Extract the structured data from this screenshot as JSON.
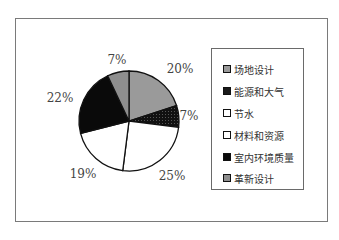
{
  "chart_data": {
    "type": "pie",
    "title": "",
    "categories": [
      "场地设计",
      "能源和大气",
      "节水",
      "材料和资源",
      "室内环境质量",
      "革新设计"
    ],
    "values": [
      20,
      7,
      25,
      19,
      22,
      7
    ],
    "unit": "%",
    "labels": [
      "20%",
      "7%",
      "25%",
      "19%",
      "22%",
      "7%"
    ],
    "colors": [
      "#9a9a9a",
      "#1a1a1a",
      "#ffffff",
      "#ffffff",
      "#0a0a0a",
      "#8e8e8e"
    ],
    "start_angle_deg": 0,
    "direction": "clockwise",
    "legend_position": "right"
  },
  "legend": {
    "items": [
      {
        "label": "场地设计",
        "color": "#9a9a9a"
      },
      {
        "label": "能源和大气",
        "color": "#1a1a1a"
      },
      {
        "label": "节水",
        "color": "#ffffff"
      },
      {
        "label": "材料和资源",
        "color": "#ffffff"
      },
      {
        "label": "室内环境质量",
        "color": "#0a0a0a"
      },
      {
        "label": "革新设计",
        "color": "#8e8e8e"
      }
    ]
  }
}
